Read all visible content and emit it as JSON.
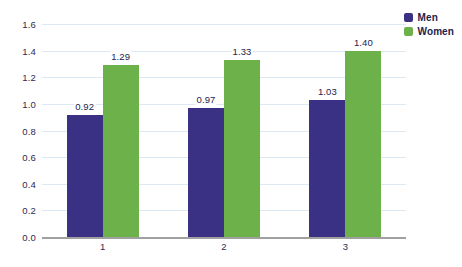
{
  "chart_data": {
    "type": "bar",
    "title": "",
    "subtitle": "",
    "xlabel": "",
    "ylabel": "",
    "categories": [
      "1",
      "2",
      "3"
    ],
    "series": [
      {
        "name": "Men",
        "color": "#3b3184",
        "values": [
          0.92,
          0.97,
          1.03
        ],
        "labels": [
          "0.92",
          "0.97",
          "1.03"
        ]
      },
      {
        "name": "Women",
        "color": "#6cb149",
        "values": [
          1.29,
          1.33,
          1.4
        ],
        "labels": [
          "1.29",
          "1.33",
          "1.40"
        ]
      }
    ],
    "ylim": [
      0.0,
      1.6
    ],
    "yticks": [
      0.0,
      0.2,
      0.4,
      0.6,
      0.8,
      1.0,
      1.2,
      1.4,
      1.6
    ],
    "ytick_labels": [
      "0.0",
      "0.2",
      "0.4",
      "0.6",
      "0.8",
      "1.0",
      "1.2",
      "1.4",
      "1.6"
    ],
    "grid": true,
    "grid_color": "#dce9f5",
    "axis_color": "#a0a0a0",
    "legend_position": "top-right",
    "background": "#ffffff",
    "data_label_color": "#23234c"
  }
}
